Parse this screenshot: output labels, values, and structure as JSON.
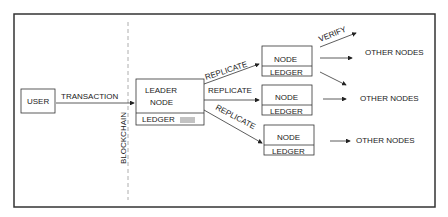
{
  "diagram": {
    "user": "USER",
    "transaction": "TRANSACTION",
    "blockchain": "BLOCKCHAIN",
    "leader": {
      "line1": "LEADER",
      "line2": "NODE",
      "ledger": "LEDGER"
    },
    "replicate": "REPLICATE",
    "verify": "VERIFY",
    "nodes": [
      {
        "label": "NODE",
        "ledger": "LEDGER"
      },
      {
        "label": "NODE",
        "ledger": "LEDGER"
      },
      {
        "label": "NODE",
        "ledger": "LEDGER"
      }
    ],
    "other_nodes": "OTHER NODES"
  }
}
